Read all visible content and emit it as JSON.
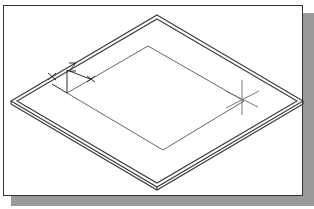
{
  "figure": {
    "colors": {
      "outline": "#3a3a3a",
      "sketch": "#555555",
      "cursor": "#888888",
      "shadow": "#9a9a9a",
      "background": "#ffffff"
    },
    "ucs_icon": {
      "labels": [
        "X",
        "Z",
        "Y"
      ]
    },
    "cursor": "crosshair-icon"
  }
}
